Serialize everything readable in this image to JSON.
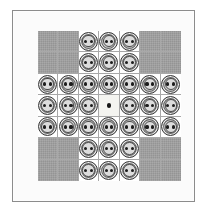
{
  "figure": {
    "frame_color": "#8c8c8c",
    "mat_color": "#fbfbfb"
  },
  "board": {
    "name": "english-peg-solitaire",
    "rows": 7,
    "columns": 7,
    "peg_count": 32,
    "empty_count": 1,
    "blocked_count": 16,
    "cell_legend": {
      "peg": "button-peg occupying a playable hole",
      "empty": "vacant centre hole marked with a dot",
      "blocked": "off-board corner square"
    },
    "colors": {
      "blocked_cell": "#949494",
      "playable_cell": "#ffffff",
      "empty_cell": "#f4f4f0",
      "grid_line": "#a8a8a8",
      "peg_face": "#d2d2d2",
      "peg_rim": "#3a3a3a",
      "peg_hole": "#1d1d1d",
      "centre_dot": "#171717"
    },
    "cells": [
      [
        "blocked",
        "blocked",
        "peg",
        "peg",
        "peg",
        "blocked",
        "blocked"
      ],
      [
        "blocked",
        "blocked",
        "peg",
        "peg",
        "peg",
        "blocked",
        "blocked"
      ],
      [
        "peg",
        "peg",
        "peg",
        "peg",
        "peg",
        "peg",
        "peg"
      ],
      [
        "peg",
        "peg",
        "peg",
        "empty",
        "peg",
        "peg",
        "peg"
      ],
      [
        "peg",
        "peg",
        "peg",
        "peg",
        "peg",
        "peg",
        "peg"
      ],
      [
        "blocked",
        "blocked",
        "peg",
        "peg",
        "peg",
        "blocked",
        "blocked"
      ],
      [
        "blocked",
        "blocked",
        "peg",
        "peg",
        "peg",
        "blocked",
        "blocked"
      ]
    ]
  }
}
